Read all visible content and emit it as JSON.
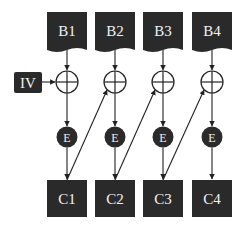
{
  "diagram": {
    "colors": {
      "block_fill": "#2a2a2a",
      "line": "#222222",
      "label": "#f2f2f2",
      "background": "#ffffff"
    },
    "iv": {
      "label": "IV"
    },
    "plaintext_blocks": [
      {
        "label": "B1"
      },
      {
        "label": "B2"
      },
      {
        "label": "B3"
      },
      {
        "label": "B4"
      }
    ],
    "xor_symbol": "⊕",
    "encrypt_nodes": [
      {
        "label": "E"
      },
      {
        "label": "E"
      },
      {
        "label": "E"
      },
      {
        "label": "E"
      }
    ],
    "ciphertext_blocks": [
      {
        "label": "C1"
      },
      {
        "label": "C2"
      },
      {
        "label": "C3"
      },
      {
        "label": "C4"
      }
    ],
    "edges": [
      "B1→XOR1",
      "B2→XOR2",
      "B3→XOR3",
      "B4→XOR4",
      "IV→XOR1",
      "XOR1→E1",
      "XOR2→E2",
      "XOR3→E3",
      "XOR4→E4",
      "E1→C1",
      "E2→C2",
      "E3→C3",
      "E4→C4",
      "C1→XOR2",
      "C2→XOR3",
      "C3→XOR4"
    ]
  }
}
